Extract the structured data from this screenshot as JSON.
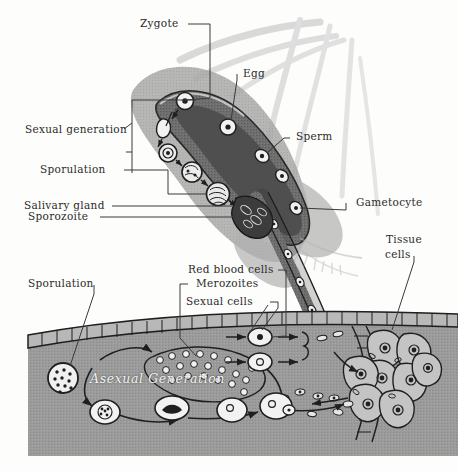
{
  "labels": {
    "zygote": "Zygote",
    "egg": "Egg",
    "sperm": "Sperm",
    "sexual_generation": "Sexual generation",
    "sporulation_top": "Sporulation",
    "salivary_gland": "Salivary gland",
    "sporozoite": "Sporozoite",
    "gametocyte": "Gametocyte",
    "tissue_cells_line1": "Tissue",
    "tissue_cells_line2": "cells",
    "sporulation_bottom": "Sporulation",
    "red_blood_cells": "Red blood cells",
    "merozoites": "Merozoites",
    "sexual_cells": "Sexual cells",
    "asexual_generation": "Asexual Generation"
  },
  "colors": {
    "paper": "#fdfdfc",
    "ink": "#2b2b2b",
    "tissue_gray": "#9b9b9b",
    "epithelium": "#a8a8a8",
    "mosquito_light": "#b9b9b9",
    "mosquito_mid": "#8e8e8e",
    "gut_dark": "#575757",
    "white_cell": "#f4f4f4",
    "asexual_text": "#f2f2f2"
  }
}
